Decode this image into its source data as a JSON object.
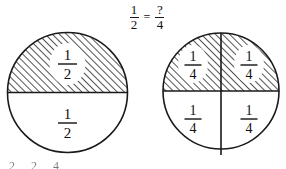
{
  "page": {
    "background_color": "#ffffff",
    "ink_color": "#111111"
  },
  "equation": {
    "left_fraction": {
      "numerator": "1",
      "denominator": "2"
    },
    "operator": "=",
    "right_fraction": {
      "numerator": "?",
      "denominator": "4"
    }
  },
  "diagrams": [
    {
      "name": "half-circle-model",
      "parts": 2,
      "shaded_parts": 1,
      "labels": [
        {
          "position": "top",
          "numerator": "1",
          "denominator": "2",
          "shaded": true
        },
        {
          "position": "bottom",
          "numerator": "1",
          "denominator": "2",
          "shaded": false
        }
      ]
    },
    {
      "name": "quarter-circle-model",
      "parts": 4,
      "shaded_parts": 2,
      "labels": [
        {
          "position": "top-left",
          "numerator": "1",
          "denominator": "4",
          "shaded": true
        },
        {
          "position": "top-right",
          "numerator": "1",
          "denominator": "4",
          "shaded": true
        },
        {
          "position": "bottom-left",
          "numerator": "1",
          "denominator": "4",
          "shaded": false
        },
        {
          "position": "bottom-right",
          "numerator": "1",
          "denominator": "4",
          "shaded": false
        }
      ]
    }
  ],
  "bottom_clipped_equation": {
    "left_fraction": {
      "numerator": "",
      "denominator": "2"
    },
    "operator": "=",
    "right_fraction": {
      "numerator": "",
      "denominator": "4"
    }
  }
}
